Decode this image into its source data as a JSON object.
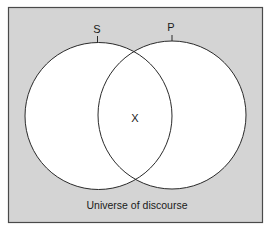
{
  "diagram": {
    "type": "venn",
    "universe_label": "Universe of discourse",
    "colors": {
      "universe_fill": "#d4d4d4",
      "universe_stroke": "#4a4a4a",
      "circle_fill": "#ffffff",
      "circle_stroke": "#2a2a2a",
      "text": "#1a1a1a"
    },
    "sets": [
      {
        "id": "S",
        "label": "S"
      },
      {
        "id": "P",
        "label": "P"
      }
    ],
    "intersection_mark": "X"
  }
}
